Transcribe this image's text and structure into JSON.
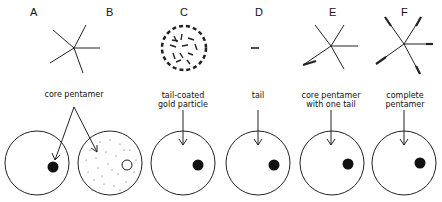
{
  "figure": {
    "panels": [
      {
        "letter": "A",
        "structure": "core-pentamer"
      },
      {
        "letter": "B",
        "structure": "core-pentamer"
      },
      {
        "letter": "C",
        "structure": "tail-coated-gold-particle"
      },
      {
        "letter": "D",
        "structure": "tail"
      },
      {
        "letter": "E",
        "structure": "core-pentamer-with-one-tail"
      },
      {
        "letter": "F",
        "structure": "complete-pentamer"
      }
    ],
    "captions": {
      "ab": "core pentamer",
      "c_line1": "tail-coated",
      "c_line2": "gold particle",
      "d": "tail",
      "e_line1": "core pentamer",
      "e_line2": "with one tail",
      "f_line1": "complete",
      "f_line2": "pentamer"
    }
  }
}
